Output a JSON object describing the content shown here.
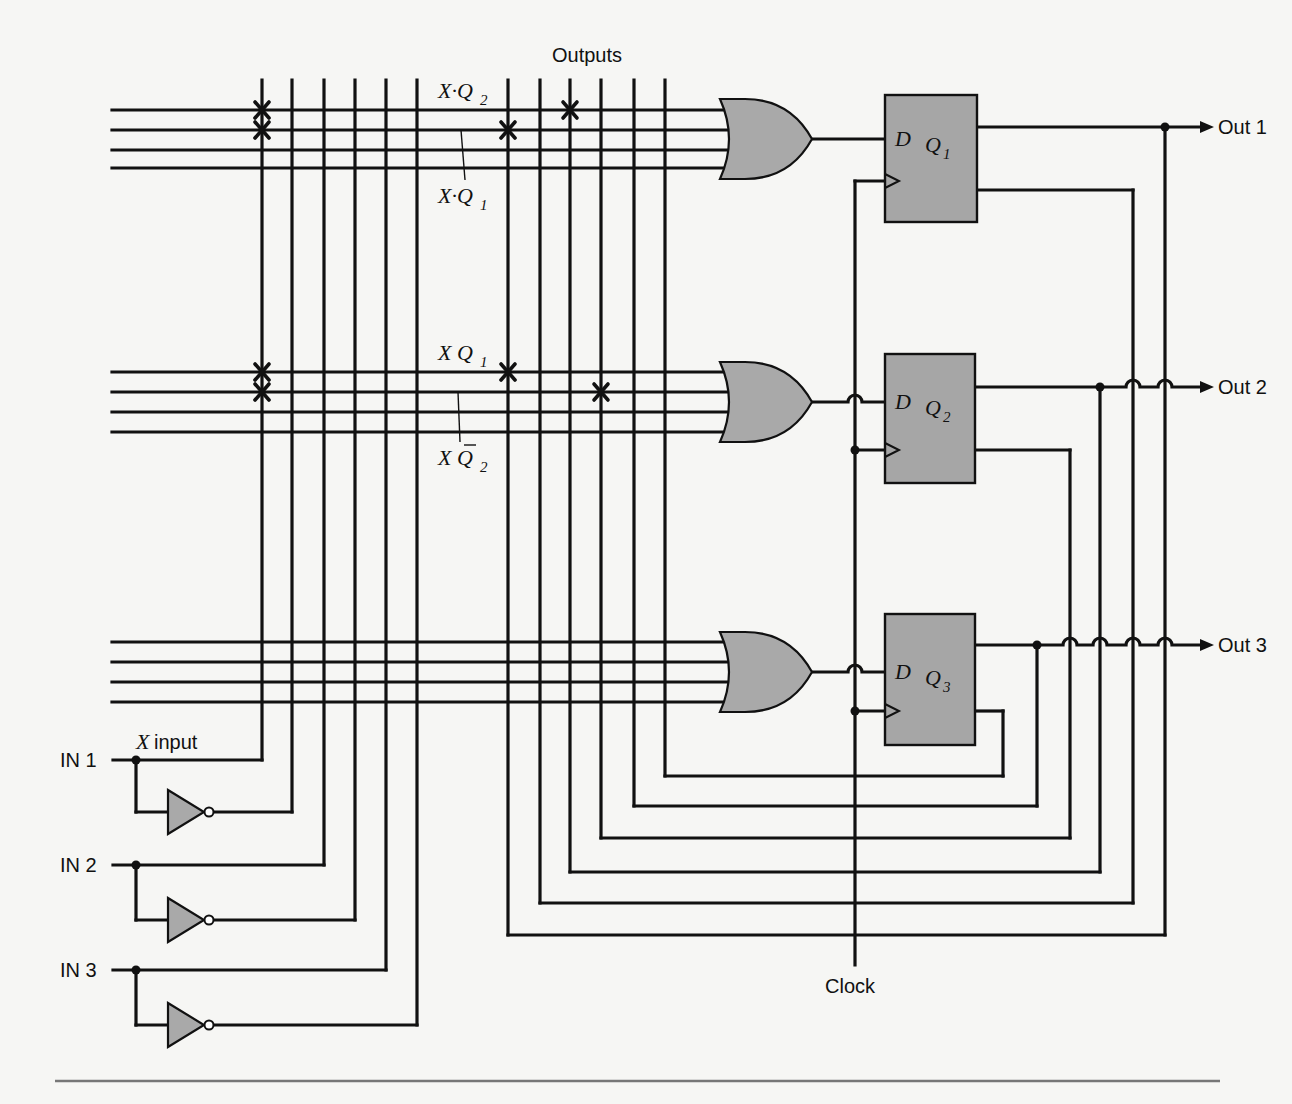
{
  "title": "Outputs",
  "clock_label": "Clock",
  "x_input_label": "input",
  "x_input_var": "X",
  "inputs": [
    {
      "label": "IN 1",
      "y": 760,
      "inv_y": 812,
      "col_true": 262,
      "col_inv": 292
    },
    {
      "label": "IN 2",
      "y": 865,
      "inv_y": 920,
      "col_true": 324,
      "col_inv": 355
    },
    {
      "label": "IN 3",
      "y": 970,
      "inv_y": 1025,
      "col_true": 386,
      "col_inv": 417
    }
  ],
  "outputs": [
    {
      "label": "Out 1",
      "y": 127
    },
    {
      "label": "Out 2",
      "y": 387
    },
    {
      "label": "Out 3",
      "y": 645
    }
  ],
  "columns": {
    "x": [
      262,
      292,
      324,
      355,
      386,
      417,
      508,
      540,
      570,
      601,
      634,
      665
    ],
    "top": 80
  },
  "arrays": [
    {
      "rows": [
        110,
        130,
        150,
        168
      ],
      "crosses": [
        [
          262,
          110
        ],
        [
          262,
          130
        ],
        [
          508,
          130
        ],
        [
          570,
          110
        ]
      ],
      "gate": {
        "x": 720,
        "cy": 139
      },
      "ff": {
        "x": 885,
        "y": 95,
        "w": 92,
        "h": 127,
        "name": "Q",
        "sub": "1",
        "q_y": 127,
        "qbar_y": 190,
        "d_y": 139,
        "clk_y": 181
      },
      "annotations": [
        {
          "text": "X·Q",
          "sub": "2",
          "x": 438,
          "y": 98
        },
        {
          "text": "X·Q",
          "sub": "1",
          "x": 438,
          "y": 203,
          "leader": [
            461,
            130,
            465,
            180
          ]
        }
      ]
    },
    {
      "rows": [
        372,
        392,
        412,
        432
      ],
      "crosses": [
        [
          262,
          372
        ],
        [
          262,
          392
        ],
        [
          508,
          372
        ],
        [
          601,
          392
        ]
      ],
      "gate": {
        "x": 720,
        "cy": 402
      },
      "ff": {
        "x": 885,
        "y": 354,
        "w": 90,
        "h": 129,
        "name": "Q",
        "sub": "2",
        "q_y": 387,
        "qbar_y": 450,
        "d_y": 402,
        "clk_y": 450
      },
      "annotations": [
        {
          "text": "X Q",
          "sub": "1",
          "x": 438,
          "y": 360
        },
        {
          "text": "X Q",
          "sub": "2",
          "x": 438,
          "y": 465,
          "bar": true,
          "leader": [
            458,
            392,
            460,
            442
          ]
        }
      ]
    },
    {
      "rows": [
        642,
        662,
        682,
        702
      ],
      "crosses": [],
      "gate": {
        "x": 720,
        "cy": 672
      },
      "ff": {
        "x": 885,
        "y": 614,
        "w": 90,
        "h": 131,
        "name": "Q",
        "sub": "3",
        "q_y": 645,
        "qbar_y": 711,
        "d_y": 672,
        "clk_y": 711
      },
      "annotations": []
    }
  ],
  "feedback": [
    {
      "col": 665,
      "y": 776,
      "rx": 1003,
      "from": "Q3bar"
    },
    {
      "col": 634,
      "y": 806,
      "rx": 1037,
      "from": "Q3"
    },
    {
      "col": 601,
      "y": 838,
      "rx": 1070,
      "from": "Q2bar"
    },
    {
      "col": 570,
      "y": 872,
      "rx": 1100,
      "from": "Q2"
    },
    {
      "col": 540,
      "y": 903,
      "rx": 1133,
      "from": "Q1bar"
    },
    {
      "col": 508,
      "y": 935,
      "rx": 1165,
      "from": "Q1"
    }
  ],
  "clock": {
    "x": 855,
    "top": 181,
    "bottom": 965
  },
  "colors": {
    "ink": "#111111",
    "gate_fill": "#a9a9a9",
    "paper": "#f6f6f4"
  }
}
